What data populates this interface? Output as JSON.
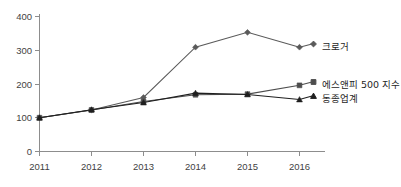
{
  "chart_data": {
    "type": "line",
    "title": "",
    "xlabel": "",
    "ylabel": "",
    "categories": [
      "2011",
      "2012",
      "2013",
      "2014",
      "2015",
      "2016"
    ],
    "x": [
      2011,
      2012,
      2013,
      2014,
      2015,
      2016
    ],
    "ylim": [
      0,
      400
    ],
    "yticks": [
      0,
      100,
      200,
      300,
      400
    ],
    "ytick_labels": [
      "0",
      "100",
      "200",
      "300",
      "400"
    ],
    "grid": false,
    "legend_position": "right-inline",
    "series": [
      {
        "name": "크로거",
        "marker": "diamond",
        "color": "#5a5a5a",
        "values": [
          100,
          123,
          160,
          309,
          353,
          309
        ]
      },
      {
        "name": "에스앤피 500 지수",
        "marker": "square",
        "color": "#4d4d4d",
        "values": [
          100,
          123,
          148,
          168,
          170,
          196
        ]
      },
      {
        "name": "동종업계",
        "marker": "triangle",
        "color": "#1f1f1f",
        "values": [
          100,
          124,
          145,
          173,
          169,
          154
        ]
      }
    ]
  },
  "axes": {
    "y_tick_labels": [
      "400",
      "300",
      "200",
      "100",
      "0"
    ],
    "x_tick_labels": [
      "2011",
      "2012",
      "2013",
      "2014",
      "2015",
      "2016"
    ]
  },
  "legend": {
    "items": [
      {
        "label": "크로거"
      },
      {
        "label": "에스앤피 500 지수"
      },
      {
        "label": "동종업계"
      }
    ]
  },
  "colors": {
    "axis": "#8d8d8d",
    "tick_text": "#3f3f3f",
    "legend_text": "#262626",
    "kroger": "#5a5a5a",
    "sp500": "#4d4d4d",
    "peers": "#1f1f1f",
    "background": "#ffffff"
  }
}
